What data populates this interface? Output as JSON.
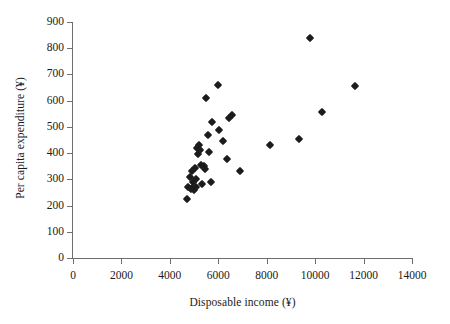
{
  "chart_data": {
    "type": "scatter",
    "title": "",
    "xlabel": "Disposable income (¥)",
    "ylabel": "Per capita expenditure (¥)",
    "xlim": [
      0,
      14000
    ],
    "ylim": [
      0,
      900
    ],
    "xticks": [
      0,
      2000,
      4000,
      6000,
      8000,
      10000,
      12000,
      14000
    ],
    "yticks": [
      0,
      100,
      200,
      300,
      400,
      500,
      600,
      700,
      800,
      900
    ],
    "xtick_labels": [
      "0",
      "2000",
      "4000",
      "6000",
      "8000",
      "10000",
      "12000",
      "14000"
    ],
    "ytick_labels": [
      "0",
      "100",
      "200",
      "300",
      "400",
      "500",
      "600",
      "700",
      "800",
      "900"
    ],
    "grid": false,
    "legend": false,
    "legend_position": "none",
    "marker": "filled-diamond",
    "marker_color": "#1c1c1c",
    "series": [
      {
        "name": "provinces",
        "points": [
          [
            4700,
            225
          ],
          [
            4760,
            270
          ],
          [
            4820,
            310
          ],
          [
            4870,
            262
          ],
          [
            4900,
            330
          ],
          [
            4930,
            268
          ],
          [
            4960,
            290
          ],
          [
            4980,
            258
          ],
          [
            5020,
            345
          ],
          [
            5060,
            272
          ],
          [
            5090,
            300
          ],
          [
            5120,
            420
          ],
          [
            5160,
            398
          ],
          [
            5200,
            430
          ],
          [
            5240,
            412
          ],
          [
            5280,
            355
          ],
          [
            5320,
            283
          ],
          [
            5400,
            352
          ],
          [
            5450,
            340
          ],
          [
            5500,
            610
          ],
          [
            5560,
            470
          ],
          [
            5620,
            405
          ],
          [
            5700,
            288
          ],
          [
            5760,
            520
          ],
          [
            5980,
            660
          ],
          [
            6050,
            490
          ],
          [
            6200,
            448
          ],
          [
            6350,
            378
          ],
          [
            6450,
            535
          ],
          [
            6550,
            545
          ],
          [
            6900,
            330
          ],
          [
            8150,
            432
          ],
          [
            9350,
            453
          ],
          [
            9800,
            840
          ],
          [
            10300,
            558
          ],
          [
            11650,
            655
          ]
        ]
      }
    ]
  },
  "axes": {
    "x": {
      "label": "Disposable income (¥)",
      "ticks": [
        "0",
        "2000",
        "4000",
        "6000",
        "8000",
        "10000",
        "12000",
        "14000"
      ]
    },
    "y": {
      "label": "Per capita expenditure (¥)",
      "ticks": [
        "0",
        "100",
        "200",
        "300",
        "400",
        "500",
        "600",
        "700",
        "800",
        "900"
      ]
    }
  },
  "style": {
    "axis_color": "#6e6e6e",
    "marker_color": "#1c1c1c",
    "background": "#ffffff",
    "text_color": "#1a1a1a"
  }
}
